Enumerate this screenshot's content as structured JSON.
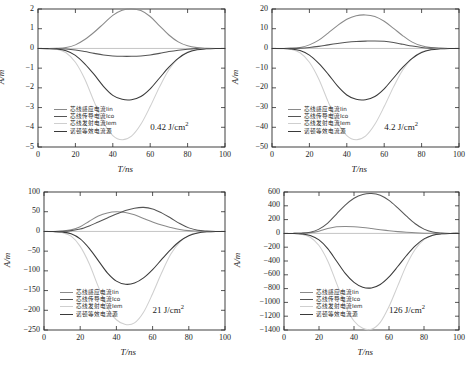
{
  "figure": {
    "axis_x_label": "T/ns",
    "axis_y_label": "A/m",
    "series_names": [
      "芯线感应电流Iin",
      "芯线传导电流Ico",
      "芯线发射电流Iem",
      "诺顿等效电流源"
    ],
    "series_colors": [
      "#8a8a8a",
      "#555555",
      "#cfcfcf",
      "#3a3a3a"
    ]
  },
  "chart_data": [
    {
      "type": "line",
      "panel": "top-left",
      "title": "",
      "annotation": "0.42 J/cm2",
      "annotation_display": "0.42 J/cm",
      "annotation_sup": "2",
      "xlabel": "T/ns",
      "ylabel": "A/m",
      "xlim": [
        0,
        100
      ],
      "ylim": [
        -5,
        2
      ],
      "xticks": [
        0,
        20,
        40,
        60,
        80,
        100
      ],
      "yticks": [
        2,
        1,
        0,
        -1,
        -2,
        -3,
        -4,
        -5
      ],
      "grid": false,
      "legend_position": "lower-left",
      "x": [
        0,
        5,
        10,
        15,
        20,
        25,
        30,
        35,
        40,
        45,
        50,
        55,
        60,
        65,
        70,
        75,
        80,
        85,
        90,
        95,
        100
      ],
      "series": [
        {
          "name": "芯线感应电流Iin",
          "color": "#8a8a8a",
          "values": [
            0,
            0,
            0.01,
            0.05,
            0.18,
            0.45,
            0.82,
            1.25,
            1.68,
            1.94,
            2.0,
            1.92,
            1.62,
            1.15,
            0.68,
            0.33,
            0.13,
            0.04,
            0.01,
            0,
            0
          ]
        },
        {
          "name": "芯线传导电流Ico",
          "color": "#555555",
          "values": [
            0,
            0,
            -0.01,
            -0.03,
            -0.08,
            -0.16,
            -0.25,
            -0.33,
            -0.38,
            -0.4,
            -0.4,
            -0.38,
            -0.33,
            -0.25,
            -0.16,
            -0.09,
            -0.04,
            -0.01,
            0,
            0,
            0
          ]
        },
        {
          "name": "芯线发射电流Iem",
          "color": "#cfcfcf",
          "values": [
            0,
            -0.01,
            -0.05,
            -0.22,
            -0.7,
            -1.55,
            -2.7,
            -3.75,
            -4.42,
            -4.63,
            -4.45,
            -3.85,
            -2.95,
            -1.95,
            -1.08,
            -0.5,
            -0.18,
            -0.05,
            -0.01,
            0,
            0
          ]
        },
        {
          "name": "诺顿等效电流源",
          "color": "#3a3a3a",
          "values": [
            0,
            -0.01,
            -0.03,
            -0.12,
            -0.35,
            -0.78,
            -1.32,
            -1.92,
            -2.38,
            -2.58,
            -2.6,
            -2.44,
            -2.05,
            -1.5,
            -0.95,
            -0.5,
            -0.21,
            -0.07,
            -0.02,
            0,
            0
          ]
        }
      ]
    },
    {
      "type": "line",
      "panel": "top-right",
      "title": "",
      "annotation": "4.2 J/cm2",
      "annotation_display": "4.2 J/cm",
      "annotation_sup": "2",
      "xlabel": "T/ns",
      "ylabel": "A/m",
      "xlim": [
        0,
        100
      ],
      "ylim": [
        -50,
        20
      ],
      "xticks": [
        0,
        20,
        40,
        60,
        80,
        100
      ],
      "yticks": [
        20,
        10,
        0,
        -10,
        -20,
        -30,
        -40,
        -50
      ],
      "grid": false,
      "legend_position": "lower-left",
      "x": [
        0,
        5,
        10,
        15,
        20,
        25,
        30,
        35,
        40,
        45,
        50,
        55,
        60,
        65,
        70,
        75,
        80,
        85,
        90,
        95,
        100
      ],
      "series": [
        {
          "name": "芯线感应电流Iin",
          "color": "#8a8a8a",
          "values": [
            0,
            0,
            0.1,
            0.5,
            1.8,
            4.2,
            7.8,
            11.6,
            14.8,
            16.6,
            17.0,
            16.2,
            13.8,
            10.2,
            6.4,
            3.2,
            1.3,
            0.4,
            0.1,
            0,
            0
          ]
        },
        {
          "name": "芯线传导电流Ico",
          "color": "#555555",
          "values": [
            0,
            0,
            0.02,
            0.15,
            0.5,
            1.05,
            1.8,
            2.5,
            3.1,
            3.5,
            3.7,
            3.8,
            3.6,
            3.0,
            2.1,
            1.2,
            0.5,
            0.15,
            0.03,
            0,
            0
          ]
        },
        {
          "name": "芯线发射电流Iem",
          "color": "#cfcfcf",
          "values": [
            0,
            -0.1,
            -0.5,
            -2.2,
            -7.0,
            -15.5,
            -27.0,
            -37.5,
            -44.2,
            -46.3,
            -44.5,
            -38.5,
            -29.5,
            -19.5,
            -10.8,
            -5.0,
            -1.8,
            -0.5,
            -0.1,
            0,
            0
          ]
        },
        {
          "name": "诺顿等效电流源",
          "color": "#3a3a3a",
          "values": [
            0,
            -0.05,
            -0.25,
            -1.1,
            -3.4,
            -7.6,
            -13.0,
            -19.0,
            -23.6,
            -25.8,
            -26.0,
            -24.4,
            -20.5,
            -15.0,
            -9.5,
            -5.0,
            -2.1,
            -0.7,
            -0.2,
            0,
            0
          ]
        }
      ]
    },
    {
      "type": "line",
      "panel": "bottom-left",
      "title": "",
      "annotation": "21 J/cm2",
      "annotation_display": "21 J/cm",
      "annotation_sup": "2",
      "xlabel": "T/ns",
      "ylabel": "A/m",
      "xlim": [
        0,
        100
      ],
      "ylim": [
        -250,
        100
      ],
      "xticks": [
        0,
        20,
        40,
        60,
        80,
        100
      ],
      "yticks": [
        100,
        50,
        0,
        -50,
        -100,
        -150,
        -200,
        -250
      ],
      "grid": false,
      "legend_position": "lower-left",
      "x": [
        0,
        5,
        10,
        15,
        20,
        25,
        30,
        35,
        40,
        45,
        50,
        55,
        60,
        65,
        70,
        75,
        80,
        85,
        90,
        95,
        100
      ],
      "series": [
        {
          "name": "芯线感应电流Iin",
          "color": "#8a8a8a",
          "values": [
            0,
            0,
            1,
            4,
            12,
            26,
            39,
            47,
            50,
            48,
            42,
            33,
            24,
            16,
            10,
            5,
            2,
            1,
            0,
            0,
            0
          ]
        },
        {
          "name": "芯线传导电流Ico",
          "color": "#555555",
          "values": [
            0,
            0,
            0.3,
            2,
            6,
            14,
            24,
            34,
            44,
            53,
            59,
            61,
            57,
            47,
            34,
            20,
            9,
            3,
            1,
            0,
            0
          ]
        },
        {
          "name": "芯线发射电流Iem",
          "color": "#cfcfcf",
          "values": [
            0,
            -0.5,
            -3,
            -12,
            -38,
            -82,
            -140,
            -192,
            -224,
            -236,
            -232,
            -205,
            -158,
            -105,
            -58,
            -27,
            -10,
            -3,
            -1,
            0,
            0
          ]
        },
        {
          "name": "诺顿等效电流源",
          "color": "#3a3a3a",
          "values": [
            0,
            -0.3,
            -1.5,
            -6,
            -19,
            -43,
            -74,
            -105,
            -126,
            -134,
            -131,
            -118,
            -97,
            -71,
            -46,
            -25,
            -11,
            -4,
            -1,
            0,
            0
          ]
        }
      ]
    },
    {
      "type": "line",
      "panel": "bottom-right",
      "title": "",
      "annotation": "126 J/cm2",
      "annotation_display": "126 J/cm",
      "annotation_sup": "2",
      "xlabel": "T/ns",
      "ylabel": "A/m",
      "xlim": [
        0,
        100
      ],
      "ylim": [
        -1400,
        600
      ],
      "xticks": [
        0,
        20,
        40,
        60,
        80,
        100
      ],
      "yticks": [
        600,
        400,
        200,
        0,
        -200,
        -400,
        -600,
        -800,
        -1000,
        -1200,
        -1400
      ],
      "grid": false,
      "legend_position": "lower-left",
      "x": [
        0,
        5,
        10,
        15,
        20,
        25,
        30,
        35,
        40,
        45,
        50,
        55,
        60,
        65,
        70,
        75,
        80,
        85,
        90,
        95,
        100
      ],
      "series": [
        {
          "name": "芯线感应电流Iin",
          "color": "#8a8a8a",
          "values": [
            0,
            0,
            2,
            10,
            32,
            70,
            95,
            100,
            96,
            85,
            70,
            54,
            39,
            26,
            16,
            8,
            3,
            1,
            0,
            0,
            0
          ]
        },
        {
          "name": "芯线传导电流Ico",
          "color": "#555555",
          "values": [
            0,
            0,
            3,
            18,
            62,
            150,
            280,
            410,
            510,
            565,
            578,
            552,
            478,
            370,
            250,
            140,
            62,
            20,
            5,
            0,
            0
          ]
        },
        {
          "name": "芯线发射电流Iem",
          "color": "#cfcfcf",
          "values": [
            0,
            -2,
            -12,
            -55,
            -175,
            -400,
            -720,
            -1040,
            -1270,
            -1375,
            -1390,
            -1290,
            -1060,
            -760,
            -460,
            -230,
            -90,
            -28,
            -7,
            0,
            0
          ]
        },
        {
          "name": "诺顿等效电流源",
          "color": "#3a3a3a",
          "values": [
            0,
            -1,
            -7,
            -30,
            -95,
            -220,
            -400,
            -580,
            -710,
            -780,
            -790,
            -740,
            -630,
            -480,
            -320,
            -180,
            -80,
            -26,
            -6,
            0,
            0
          ]
        }
      ]
    }
  ]
}
